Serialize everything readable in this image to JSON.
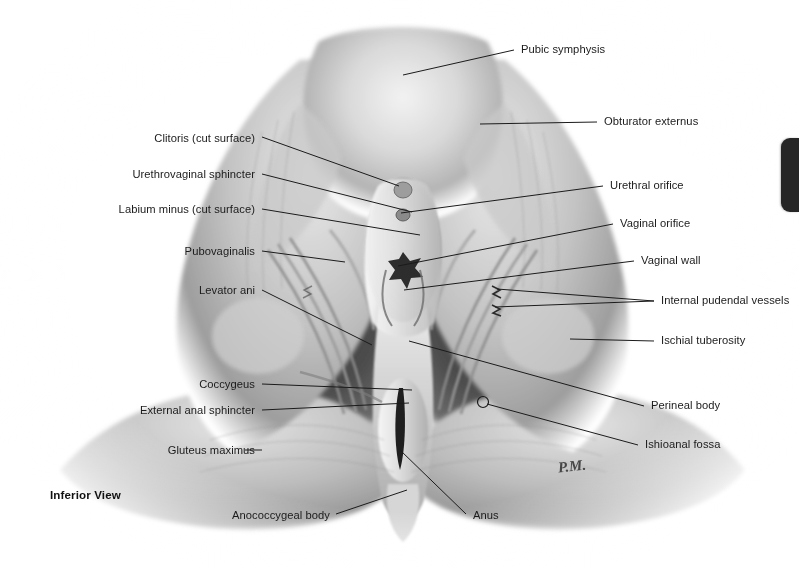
{
  "plate": {
    "view_note": "Inferior View",
    "artist_signature": "P.M.",
    "background_color": "#ffffff",
    "ink_color": "#1b1b1b",
    "tab_color": "#262626"
  },
  "labels_left": [
    {
      "text": "Clitoris (cut surface)",
      "x": 255,
      "y": 139,
      "lx": 262,
      "ly": 137,
      "tx": 399,
      "ty": 186
    },
    {
      "text": "Urethrovaginal sphincter",
      "x": 255,
      "y": 175,
      "lx": 262,
      "ly": 174,
      "tx": 412,
      "ty": 212
    },
    {
      "text": "Labium minus (cut surface)",
      "x": 255,
      "y": 210,
      "lx": 262,
      "ly": 209,
      "tx": 420,
      "ty": 235
    },
    {
      "text": "Pubovaginalis",
      "x": 255,
      "y": 252,
      "lx": 262,
      "ly": 251,
      "tx": 345,
      "ty": 262
    },
    {
      "text": "Levator ani",
      "x": 255,
      "y": 291,
      "lx": 262,
      "ly": 290,
      "tx": 372,
      "ty": 345
    },
    {
      "text": "Coccygeus",
      "x": 255,
      "y": 385,
      "lx": 262,
      "ly": 384,
      "tx": 412,
      "ty": 390
    },
    {
      "text": "External anal sphincter",
      "x": 255,
      "y": 411,
      "lx": 262,
      "ly": 410,
      "tx": 409,
      "ty": 403
    },
    {
      "text": "Gluteus maximus",
      "x": 255,
      "y": 451,
      "lx": 262,
      "ly": 450,
      "tx": 245,
      "ty": 450
    },
    {
      "text": "Anococcygeal body",
      "x": 330,
      "y": 516,
      "lx": 336,
      "ly": 514,
      "tx": 407,
      "ty": 490
    }
  ],
  "labels_right": [
    {
      "text": "Pubic symphysis",
      "x": 521,
      "y": 50,
      "lx": 514,
      "ly": 50,
      "tx": 403,
      "ty": 75
    },
    {
      "text": "Obturator externus",
      "x": 604,
      "y": 122,
      "lx": 597,
      "ly": 122,
      "tx": 480,
      "ty": 124
    },
    {
      "text": "Urethral orifice",
      "x": 610,
      "y": 186,
      "lx": 603,
      "ly": 186,
      "tx": 401,
      "ty": 213
    },
    {
      "text": "Vaginal orifice",
      "x": 620,
      "y": 224,
      "lx": 613,
      "ly": 224,
      "tx": 398,
      "ty": 266
    },
    {
      "text": "Vaginal wall",
      "x": 641,
      "y": 261,
      "lx": 634,
      "ly": 261,
      "tx": 404,
      "ty": 290
    },
    {
      "text": "Internal pudendal vessels",
      "x": 661,
      "y": 301,
      "lx": 654,
      "ly": 301,
      "tx": 495,
      "ty": 307
    },
    {
      "text": "Ischial tuberosity",
      "x": 661,
      "y": 341,
      "lx": 654,
      "ly": 341,
      "tx": 570,
      "ty": 339
    },
    {
      "text": "Perineal body",
      "x": 651,
      "y": 406,
      "lx": 644,
      "ly": 406,
      "tx": 409,
      "ty": 341
    },
    {
      "text": "Ishioanal fossa",
      "x": 645,
      "y": 445,
      "lx": 638,
      "ly": 445,
      "tx": 487,
      "ty": 404
    },
    {
      "text": "Anus",
      "x": 473,
      "y": 516,
      "lx": 466,
      "ly": 514,
      "tx": 400,
      "ty": 450
    }
  ],
  "extra_leaders": [
    {
      "lx": 654,
      "ly": 301,
      "tx": 497,
      "ty": 289
    }
  ],
  "markers": [
    {
      "name": "perineal-body-marker",
      "x": 483,
      "y": 402,
      "r": 5.5
    }
  ],
  "edge_tab": {
    "label": "page-edge-tab"
  }
}
